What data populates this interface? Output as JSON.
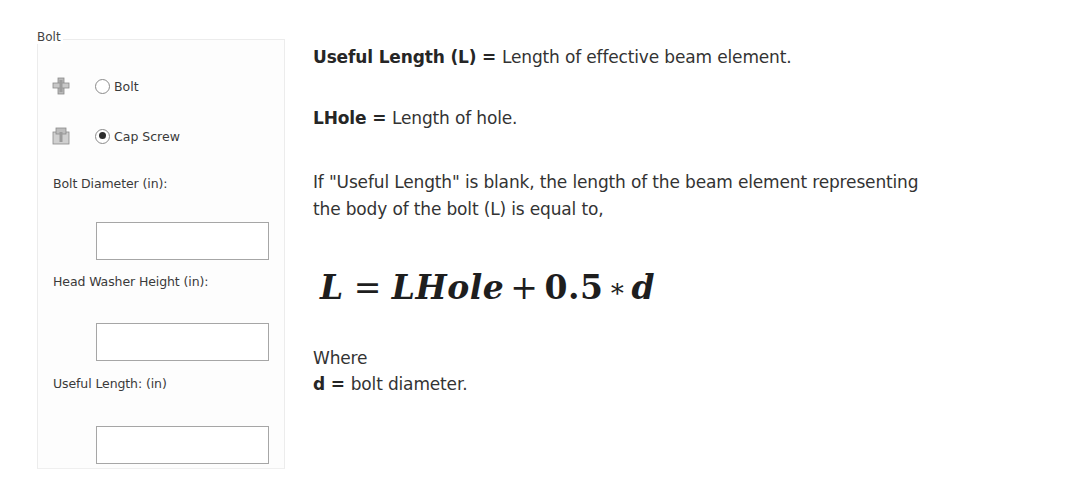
{
  "panel": {
    "group_title": "Bolt",
    "fastener_types": [
      {
        "label": "Bolt",
        "icon": "bolt-icon",
        "selected": false
      },
      {
        "label": "Cap Screw",
        "icon": "cap-screw-icon",
        "selected": true
      }
    ],
    "fields": [
      {
        "label": "Bolt Diameter (in):",
        "value": ""
      },
      {
        "label": "Head Washer Height (in):",
        "value": ""
      },
      {
        "label": "Useful Length: (in)",
        "value": ""
      }
    ]
  },
  "doc": {
    "def1": {
      "term": "Useful Length (L)",
      "eq": " = ",
      "text": "Length of effective beam element."
    },
    "def2": {
      "term": "LHole",
      "eq": " = ",
      "text": "Length of hole."
    },
    "para_line1": "If \"Useful Length\" is blank, the length of the beam element representing",
    "para_line2": "the body of the bolt (L) is equal to,",
    "formula": {
      "lhs": "L",
      "equals": "=",
      "term1": "LHole",
      "plus": "+",
      "coef": "0.5",
      "times": "∗",
      "var": "d"
    },
    "where_label": "Where",
    "def3": {
      "term": "d",
      "eq": " = ",
      "text": "bolt diameter."
    }
  }
}
